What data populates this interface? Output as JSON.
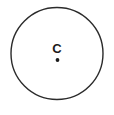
{
  "figure": {
    "kind": "geometry-diagram",
    "background_color": "#ffffff",
    "stroke_color": "#2b2b2b",
    "label_color": "#1c1c1c",
    "width": 114,
    "height": 115,
    "circle": {
      "name": "circle-outline",
      "center_x": 57,
      "center_y": 53.5,
      "radius": 46,
      "stroke_width": 1.4,
      "fill": "none"
    },
    "center_point": {
      "name": "center-dot",
      "x": 57.5,
      "y": 60,
      "radius": 1.9,
      "fill": "#1c1c1c"
    },
    "center_label": {
      "name": "center-label",
      "text": "C",
      "x": 57,
      "y": 49,
      "font_size": 13,
      "font_weight": "bold"
    }
  }
}
